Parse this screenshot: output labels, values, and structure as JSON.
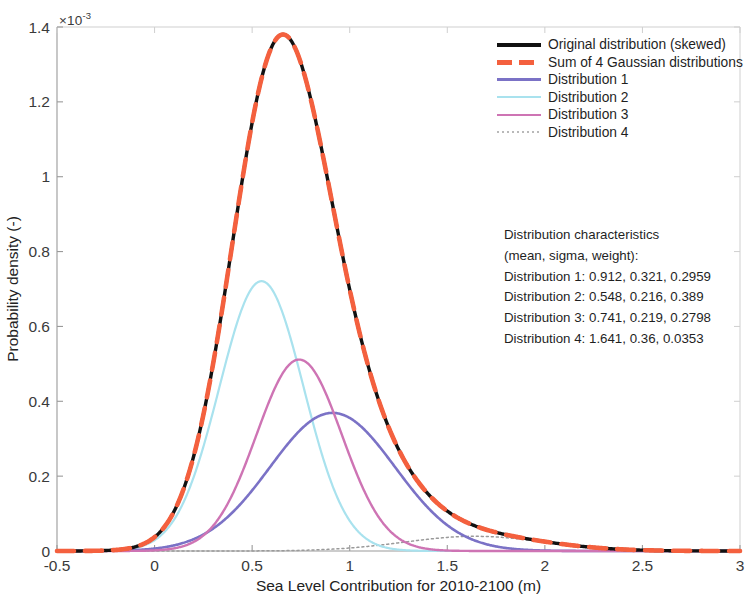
{
  "chart_data": {
    "type": "line",
    "title": "",
    "xlabel": "Sea Level Contribution for 2010-2100 (m)",
    "ylabel": "Probability density (-)",
    "y_exponent_prefix": "×10",
    "y_exponent_power": "-3",
    "xlim": [
      -0.5,
      3
    ],
    "ylim": [
      0,
      0.0014
    ],
    "xticks": [
      "-0.5",
      "0",
      "0.5",
      "1",
      "1.5",
      "2",
      "2.5",
      "3"
    ],
    "xtick_values": [
      -0.5,
      0,
      0.5,
      1,
      1.5,
      2,
      2.5,
      3
    ],
    "yticks": [
      "0",
      "0.2",
      "0.4",
      "0.6",
      "0.8",
      "1",
      "1.2",
      "1.4"
    ],
    "ytick_values": [
      0,
      0.0002,
      0.0004,
      0.0006,
      0.0008,
      0.001,
      0.0012,
      0.0014
    ],
    "grid": false,
    "legend_position": "top-right",
    "scale_factor": 0.001,
    "series": [
      {
        "name": "Original distribution (skewed)",
        "color": "#111111",
        "style": "solid",
        "width": 3.4,
        "kind": "mixture",
        "peak_x": 0.66,
        "peak_y": 0.00138
      },
      {
        "name": "Sum of 4 Gaussian distributions",
        "color": "#F4603E",
        "style": "dashed",
        "width": 4.6,
        "kind": "mixture",
        "peak_x": 0.66,
        "peak_y": 0.00138
      },
      {
        "name": "Distribution 1",
        "color": "#7B72C6",
        "style": "solid",
        "width": 2.6,
        "kind": "gaussian",
        "mean": 0.912,
        "sigma": 0.321,
        "weight": 0.2959,
        "peak_y": 0.00037
      },
      {
        "name": "Distribution 2",
        "color": "#A9E2EE",
        "style": "solid",
        "width": 2.2,
        "kind": "gaussian",
        "mean": 0.548,
        "sigma": 0.216,
        "weight": 0.389,
        "peak_y": 0.00072
      },
      {
        "name": "Distribution 3",
        "color": "#CE74B4",
        "style": "solid",
        "width": 2.4,
        "kind": "gaussian",
        "mean": 0.741,
        "sigma": 0.219,
        "weight": 0.2798,
        "peak_y": 0.00051
      },
      {
        "name": "Distribution 4",
        "color": "#9a9a9a",
        "style": "dotted",
        "width": 1.5,
        "kind": "gaussian",
        "mean": 1.641,
        "sigma": 0.36,
        "weight": 0.0353,
        "peak_y": 3.9e-05
      }
    ]
  },
  "legend": {
    "items": [
      {
        "label": "Original distribution (skewed)",
        "swatch": "sw-solid-black"
      },
      {
        "label": "Sum of 4 Gaussian distributions",
        "swatch": "sw-dash-orange"
      },
      {
        "label": "Distribution 1",
        "swatch": "sw-purple"
      },
      {
        "label": "Distribution 2",
        "swatch": "sw-cyan"
      },
      {
        "label": "Distribution 3",
        "swatch": "sw-magenta"
      },
      {
        "label": "Distribution 4",
        "swatch": "sw-dot-gray"
      }
    ]
  },
  "annotation": {
    "lines": [
      "Distribution characteristics",
      "(mean, sigma, weight):",
      "Distribution 1: 0.912, 0.321, 0.2959",
      "Distribution 2: 0.548, 0.216, 0.389",
      "Distribution 3: 0.741, 0.219, 0.2798",
      "Distribution 4: 1.641, 0.36, 0.0353"
    ]
  }
}
